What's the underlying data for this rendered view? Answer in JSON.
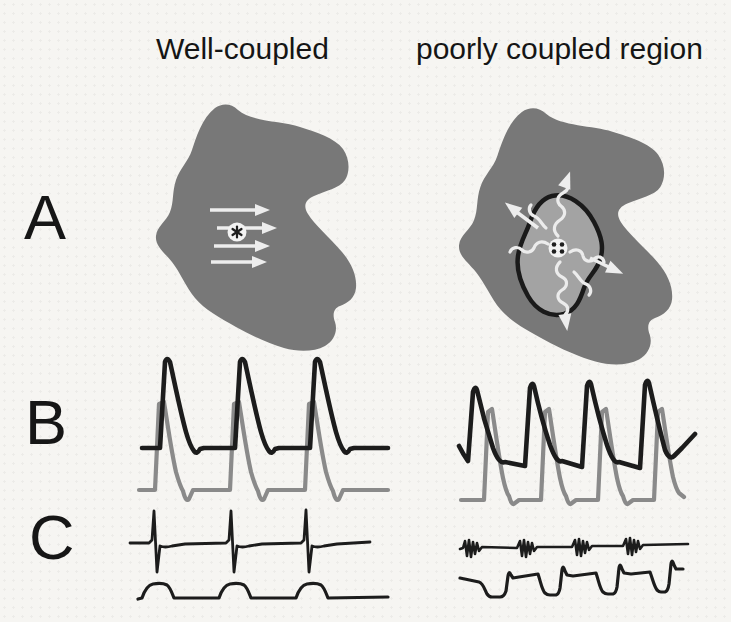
{
  "page": {
    "background_color": "#f6f5f2"
  },
  "headers": {
    "left_column_title": "Well-coupled",
    "right_column_title": "poorly coupled region"
  },
  "row_labels": {
    "row_a": "A",
    "row_b": "B",
    "row_c": "C"
  },
  "panel_a": {
    "left": {
      "tissue_color": "#787878",
      "arrow_color": "#ededed",
      "planar_wavefront_arrow_count": 4,
      "electrode_icon": "circle-with-asterisk"
    },
    "right": {
      "tissue_color": "#787878",
      "inner_region_color": "#a3a3a3",
      "inner_region_outline_color": "#1a1a1a",
      "tortuous_path_color": "#ececec",
      "outward_arrow_count": 4,
      "electrode_icon": "circle-with-four-dots"
    }
  },
  "panel_b": {
    "black_trace_color": "#1c1c1c",
    "gray_trace_color": "#8a8a8a",
    "left": {
      "black_trace_beats": 3,
      "gray_trace_beats": 3
    },
    "right": {
      "black_trace_beats": 4,
      "gray_trace_beats": 4
    }
  },
  "panel_c": {
    "trace_color": "#1c1c1c",
    "left": {
      "top_trace_spikes": 3,
      "bottom_trace_waves": 3
    },
    "right": {
      "top_trace_fractionated_bursts": 4,
      "bottom_trace_deflections": 4
    }
  }
}
